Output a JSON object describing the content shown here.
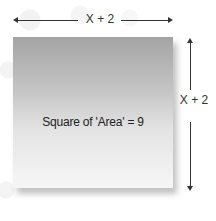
{
  "diagram": {
    "top_dimension_label": "X + 2",
    "side_dimension_label": "X + 2",
    "square_label": "Square of 'Area' = 9",
    "colors": {
      "square_top": "#a4a4a4",
      "square_bottom": "#f6f6f6",
      "arrow": "#333333",
      "text": "#222222"
    }
  }
}
